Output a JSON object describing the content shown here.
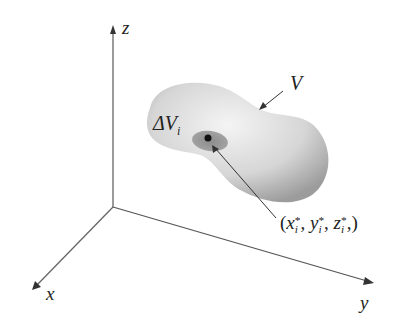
{
  "diagram": {
    "axes": {
      "z_label": "z",
      "x_label": "x",
      "y_label": "y"
    },
    "region_label": "V",
    "subregion_label": "ΔV",
    "subregion_subscript": "i",
    "point_label": {
      "open": "(",
      "x": "x",
      "y": "y",
      "z": "z",
      "sup": "*",
      "sub": "i",
      "close": ")"
    },
    "colors": {
      "axis": "#555555",
      "solid_light": "#f2f2f2",
      "solid_dark": "#9a9a9a",
      "subregion": "#8a8a8a",
      "point": "#111111"
    }
  }
}
